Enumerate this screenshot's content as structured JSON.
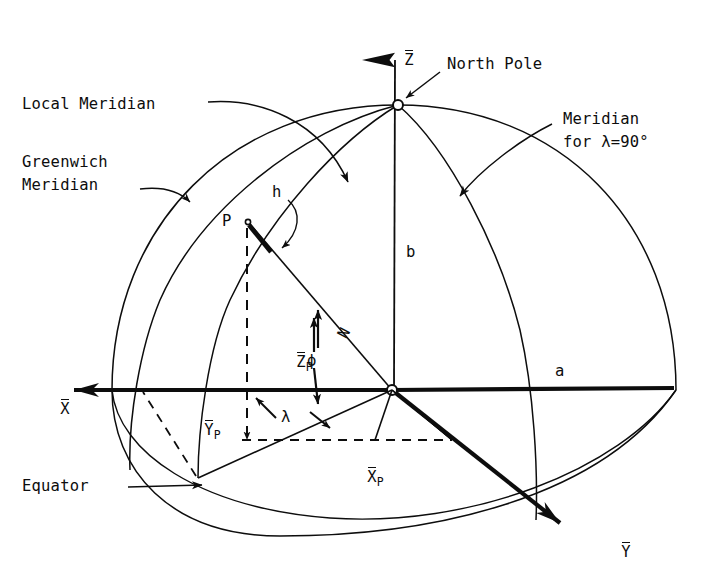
{
  "figure": {
    "kind": "geodetic-coordinates-diagram",
    "ink_color": "#0d0d0d",
    "background_color": "#ffffff"
  },
  "labels": {
    "local_meridian": "Local Meridian",
    "greenwich_meridian_line1": "Greenwich",
    "greenwich_meridian_line2": "Meridian",
    "north_pole": "North Pole",
    "meridian_90_line1": "Meridian",
    "meridian_90_line2": "for λ=90°",
    "equator": "Equator",
    "point_p": "P",
    "height_h": "h",
    "semi_minor_b": "b",
    "semi_major_a": "a",
    "normal_n": "N",
    "latitude_phi": "ϕ",
    "longitude_lambda": "λ"
  },
  "axes": {
    "z_axis": {
      "letter": "Z",
      "overbar": true
    },
    "x_axis": {
      "letter": "X",
      "overbar": true
    },
    "y_axis": {
      "letter": "Y",
      "overbar": true
    }
  },
  "components": {
    "z_p": {
      "letter": "Z",
      "subscript": "P",
      "overbar": true
    },
    "y_p": {
      "letter": "Y",
      "subscript": "P",
      "overbar": true
    },
    "x_p": {
      "letter": "X",
      "subscript": "P",
      "overbar": true
    }
  },
  "geometry": {
    "origin": {
      "x": 392,
      "y": 390
    },
    "north_pole": {
      "x": 398,
      "y": 105
    },
    "point_p": {
      "x": 248,
      "y": 222
    },
    "ground_point": {
      "x": 198,
      "y": 478
    },
    "z_arrow_tip": {
      "x": 396,
      "y": 26
    },
    "x_arrow_tip": {
      "x": 58,
      "y": 390
    },
    "y_arrow_tip": {
      "x": 576,
      "y": 534
    },
    "sphere_radius_x": 280,
    "sphere_radius_y": 283
  }
}
